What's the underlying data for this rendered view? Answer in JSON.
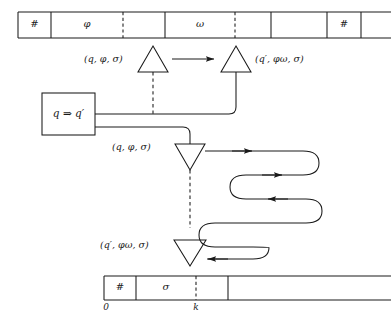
{
  "figure": {
    "kind": "turing-machine-transition-diagram",
    "ink_color": "#1a1a1a",
    "background": "#ffffff"
  },
  "top_tape": {
    "name": "work-tape",
    "cells": [
      {
        "id": "c0",
        "symbol": "#",
        "x": 18,
        "width": 33
      },
      {
        "id": "c1",
        "symbol": "φ",
        "x": 51,
        "width": 72
      },
      {
        "id": "c2",
        "symbol": "",
        "x": 123,
        "width": 42
      },
      {
        "id": "c3",
        "symbol": "ω",
        "x": 165,
        "width": 70
      },
      {
        "id": "c4",
        "symbol": "",
        "x": 235,
        "width": 36
      },
      {
        "id": "c5",
        "symbol": "",
        "x": 271,
        "width": 56
      },
      {
        "id": "c6",
        "symbol": "#",
        "x": 327,
        "width": 34
      },
      {
        "id": "c7",
        "symbol": "",
        "x": 361,
        "width": 30
      }
    ],
    "dashed_dividers": [
      123,
      235
    ],
    "top_y": 12,
    "bottom_y": 38
  },
  "bottom_tape": {
    "name": "counter-tape",
    "cells": [
      {
        "id": "b0",
        "symbol": "#",
        "x": 104,
        "width": 32
      },
      {
        "id": "b1",
        "symbol": "σ",
        "x": 136,
        "width": 60
      },
      {
        "id": "b2",
        "symbol": "",
        "x": 196,
        "width": 32
      },
      {
        "id": "b3",
        "symbol": "",
        "x": 228,
        "width": 163
      }
    ],
    "dashed_dividers": [
      196
    ],
    "top_y": 276,
    "bottom_y": 300,
    "index_labels": [
      {
        "text": "0",
        "x": 106,
        "y": 307
      },
      {
        "text": "k",
        "x": 196,
        "y": 307
      }
    ]
  },
  "state_box": {
    "name": "state-transition-box",
    "label": "q ⇒ q′",
    "x": 42,
    "y": 93,
    "width": 53,
    "height": 42
  },
  "nodes": [
    {
      "id": "n1",
      "name": "read-head-up-left",
      "shape": "triangle-up",
      "cx": 153,
      "cy": 72,
      "half": 15,
      "height": 26,
      "label": "(q, φ, σ)",
      "label_x": 134,
      "label_y": 60,
      "label_anchor": "end"
    },
    {
      "id": "n2",
      "name": "write-head-up-right",
      "shape": "triangle-up",
      "cx": 236,
      "cy": 72,
      "half": 15,
      "height": 26,
      "label": "(q′, φω, σ)",
      "label_x": 255,
      "label_y": 60,
      "label_anchor": "start"
    },
    {
      "id": "n3",
      "name": "read-head-down-mid",
      "shape": "triangle-down",
      "cx": 190,
      "cy": 144,
      "half": 15,
      "height": 26,
      "label": "(q, φ, σ)",
      "label_x": 172,
      "label_y": 154,
      "label_anchor": "end"
    },
    {
      "id": "n4",
      "name": "write-head-down-bottom",
      "shape": "triangle-down",
      "cx": 190,
      "cy": 240,
      "half": 16,
      "height": 26,
      "label": "(q′, φω, σ)",
      "label_x": 172,
      "label_y": 250,
      "label_anchor": "end"
    }
  ],
  "connectors": {
    "top_arrow": {
      "name": "top-transition-arrow",
      "x1": 172,
      "x2": 216,
      "y": 60
    },
    "dashed_vertical_top": {
      "name": "dashed-link-upper",
      "x": 153,
      "y1": 72,
      "y2": 113
    },
    "dashed_vertical_bottom": {
      "name": "dashed-link-lower",
      "x": 190,
      "y1": 170,
      "y2": 227
    },
    "serpentine": {
      "name": "serpentine-feedback-path",
      "description": "S-curved routed wire from middle down-triangle out to the right, winding back and left into the bottom down-triangle"
    }
  }
}
